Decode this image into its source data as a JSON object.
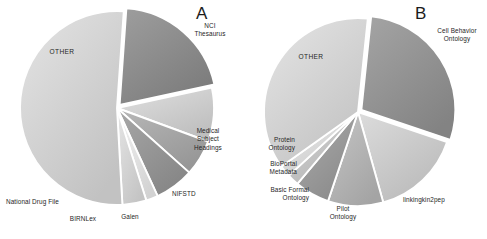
{
  "figure": {
    "background": "#ffffff",
    "panels": [
      {
        "letter": "A",
        "letter_pos": {
          "x": 200,
          "y": 6
        },
        "center": {
          "x": 117,
          "y": 108
        },
        "radius": 97
      },
      {
        "letter": "B",
        "letter_pos": {
          "x": 418,
          "y": 6
        },
        "center": {
          "x": 358,
          "y": 112
        },
        "radius": 94
      }
    ]
  },
  "chart_data": [
    {
      "type": "pie",
      "title": "A",
      "panel": "A",
      "start_angle_deg": -86,
      "direction": "clockwise",
      "labels": [
        "NCI Thesaurus",
        "Medical Subject Headings",
        "NIFSTD",
        "Galen",
        "BIRNLex",
        "National Drug File",
        "OTHER"
      ],
      "values": [
        20.5,
        9.0,
        6.0,
        6.5,
        2.0,
        4.0,
        52.0
      ],
      "colors": [
        "#8e8e8e",
        "#d0d0d0",
        "#a8a8a8",
        "#989898",
        "#e4e4e4",
        "#d6d6d6",
        "#d4d4d4"
      ],
      "explode": [
        true,
        false,
        false,
        false,
        false,
        false,
        false
      ],
      "legend": "none",
      "grid": false
    },
    {
      "type": "pie",
      "title": "B",
      "panel": "B",
      "start_angle_deg": -84,
      "direction": "clockwise",
      "labels": [
        "Cell Behavior Ontology",
        "linkingkin2pep",
        "Pilot Ontology",
        "Basic Formal Ontology",
        "BioPortal Metadata",
        "Protein Ontology",
        "OTHER"
      ],
      "values": [
        28.5,
        15.5,
        9.5,
        6.0,
        2.0,
        2.0,
        36.5
      ],
      "colors": [
        "#959595",
        "#cccccc",
        "#b6b6b6",
        "#9c9c9c",
        "#c6c6c6",
        "#dcdcdc",
        "#d5d5d5"
      ],
      "explode": [
        true,
        false,
        false,
        false,
        false,
        false,
        false
      ],
      "legend": "none",
      "grid": false
    }
  ],
  "panel_a": {
    "letter": "A",
    "labels": {
      "nci_thesaurus": "NCI\nThesaurus",
      "medical_subject_headings": "Medical\nSubject\nHeadings",
      "nifstd": "NIFSTD",
      "galen": "Galen",
      "birnlex": "BIRNLex",
      "national_drug_file": "National Drug File",
      "other": "OTHER"
    }
  },
  "panel_b": {
    "letter": "B",
    "labels": {
      "cell_behavior_ontology": "Cell Behavior\nOntology",
      "linkingkin2pep": "linkingkin2pep",
      "pilot_ontology": "Pilot\nOntology",
      "basic_formal_ontology": "Basic Formal\nOntology",
      "bioportal_metadata": "BioPortal\nMetadata",
      "protein_ontology": "Protein\nOntology",
      "other": "OTHER"
    }
  }
}
